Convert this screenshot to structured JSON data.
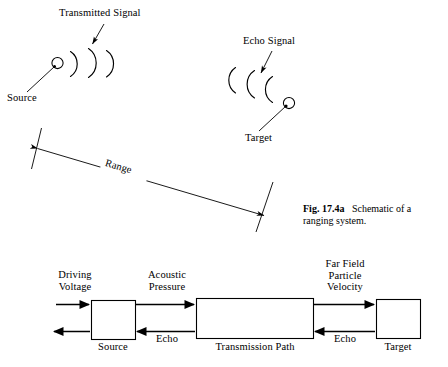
{
  "figure": {
    "caption_bold": "Fig. 17.4a",
    "caption_text": "Schematic of a ranging system."
  },
  "ranging_schematic": {
    "transmitted_signal_label": "Transmitted Signal",
    "echo_signal_label": "Echo Signal",
    "source_label": "Source",
    "target_label": "Target",
    "range_label": "Range",
    "transmitted_arc_count": 3,
    "echo_arc_count": 3,
    "source_marker": "circle",
    "target_marker": "circle",
    "range_arrow_style": "double-headed"
  },
  "block_diagram": {
    "blocks": [
      {
        "id": "source",
        "label": "Source"
      },
      {
        "id": "transmission-path",
        "label": "Transmission Path"
      },
      {
        "id": "target",
        "label": "Target"
      }
    ],
    "forward_signals": [
      {
        "id": "driving-voltage",
        "label": "Driving\nVoltage"
      },
      {
        "id": "acoustic-pressure",
        "label": "Acoustic\nPressure"
      },
      {
        "id": "far-field-particle-velocity",
        "label": "Far Field\nParticle\nVelocity"
      }
    ],
    "return_signals": [
      {
        "id": "echo-left",
        "label": "Echo"
      },
      {
        "id": "echo-right",
        "label": "Echo"
      }
    ],
    "output_arrow_label": ""
  },
  "colors": {
    "ink": "#000000",
    "background": "#ffffff",
    "line": "#1a1a1a"
  }
}
